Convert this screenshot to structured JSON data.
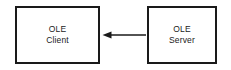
{
  "diagram": {
    "background_color": "#ffffff",
    "stroke_color": "#1a1a1a",
    "nodes": [
      {
        "id": "ole-client",
        "shape": "rectangle",
        "line1": "OLE",
        "line2": "Client"
      },
      {
        "id": "ole-server",
        "shape": "rectangle",
        "line1": "OLE",
        "line2": "Server"
      }
    ],
    "connectors": [
      {
        "id": "server-to-client",
        "from": "ole-server",
        "to": "ole-client",
        "style": "solid",
        "direction": "left",
        "arrowhead": "filled-triangle",
        "label": ""
      }
    ]
  }
}
